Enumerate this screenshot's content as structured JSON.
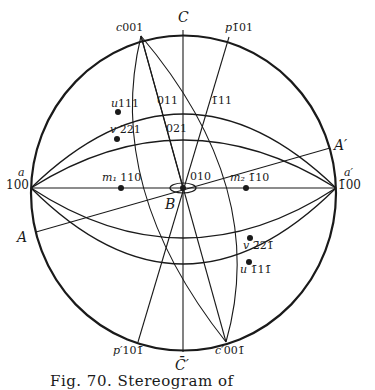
{
  "figure": {
    "caption": "Fig. 70.   Stereogram of",
    "axes": {
      "C": "C",
      "C_prime": "C̄′",
      "A": "A",
      "A_prime": "A′",
      "B": "B"
    },
    "poles": {
      "c001": {
        "letter": "c",
        "index": "001"
      },
      "p_101": {
        "letter": "p",
        "index": "1̄01"
      },
      "a100": {
        "letter": "a",
        "index": "100"
      },
      "a_prime_100": {
        "letter": "a′",
        "index": "1̄00"
      },
      "u111": {
        "letter": "u",
        "index": "111"
      },
      "v221": {
        "letter": "v",
        "index": "221"
      },
      "m1_110": {
        "letter": "m₁",
        "index": "110"
      },
      "m2_110": {
        "letter": "m₂",
        "index": "1̄10"
      },
      "o011": {
        "letter": "",
        "index": "011"
      },
      "o021": {
        "letter": "",
        "index": "021"
      },
      "o_111": {
        "letter": "",
        "index": "1̄11"
      },
      "o010": {
        "letter": "",
        "index": "010"
      },
      "v_221": {
        "letter": "v",
        "index": "2̄21̄"
      },
      "u_111": {
        "letter": "u",
        "index": "1̄11̄"
      },
      "p_prime_101": {
        "letter": "p′",
        "index": "101̄"
      },
      "c_prime_001": {
        "letter": "c′",
        "index": "001̄"
      }
    },
    "stroke_color": "#1a1a1a",
    "background": "#ffffff"
  }
}
